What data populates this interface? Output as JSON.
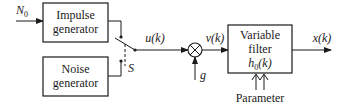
{
  "diagram": {
    "input_label": "N",
    "input_subscript": "0",
    "blocks": {
      "impulse": {
        "line1": "Impulse",
        "line2": "generator"
      },
      "noise": {
        "line1": "Noise",
        "line2": "generator"
      },
      "filter": {
        "line1": "Variable",
        "line2": "filter",
        "line3_main": "h",
        "line3_sub": "0",
        "line3_arg": "(k)"
      }
    },
    "switch_label": "S",
    "signals": {
      "u": "u(k)",
      "v": "v(k)",
      "x": "x(k)",
      "gain": "g"
    },
    "parameter_label": "Parameter"
  }
}
